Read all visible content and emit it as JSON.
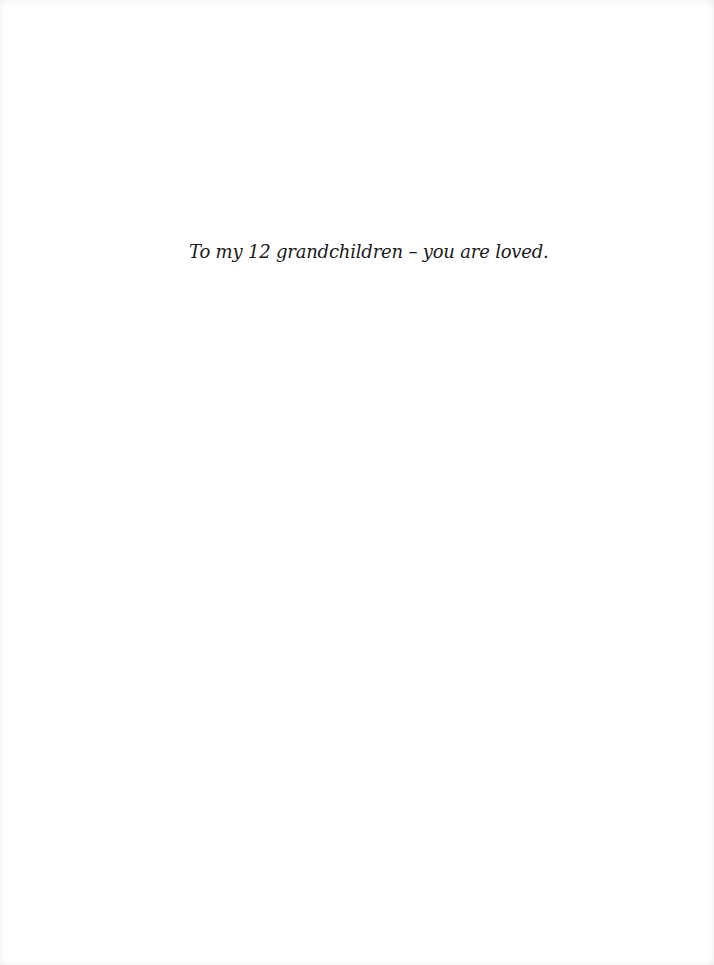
{
  "document": {
    "type": "dedication-page",
    "dedication_text": "To my 12 grandchildren – you are loved.",
    "colors": {
      "page_background": "#ffffff",
      "text": "#1a1a1a"
    }
  }
}
